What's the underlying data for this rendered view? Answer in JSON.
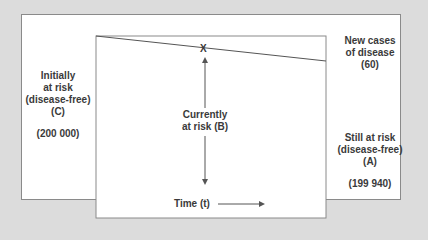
{
  "diagram": {
    "colors": {
      "background": "#dcdcdc",
      "panel": "#ffffff",
      "line": "#555555",
      "text": "#3a3a3a"
    },
    "left_label": {
      "line1": "Initially",
      "line2": "at risk",
      "line3": "(disease-free)",
      "line4": "(C)",
      "value": "(200 000)"
    },
    "center_label": {
      "line1": "Currently",
      "line2": "at risk (B)"
    },
    "marker": "X",
    "top_right_label": {
      "line1": "New cases",
      "line2": "of disease",
      "value": "(60)"
    },
    "bottom_right_label": {
      "line1": "Still at risk",
      "line2": "(disease-free)",
      "line3": "(A)",
      "value": "(199 940)"
    },
    "x_axis_label": "Time (t)"
  }
}
